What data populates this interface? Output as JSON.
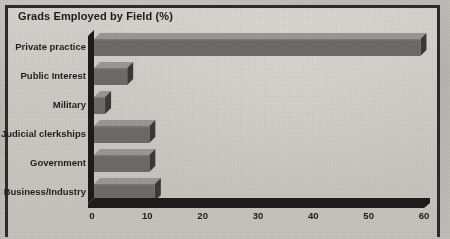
{
  "chart_data": {
    "type": "bar",
    "orientation": "horizontal",
    "title": "Grads Employed by Field (%)",
    "xlabel": "",
    "ylabel": "",
    "categories": [
      "Private practice",
      "Public Interest",
      "Military",
      "Judicial clerkships",
      "Government",
      "Business/Industry"
    ],
    "values": [
      59,
      6,
      2,
      10,
      10,
      11
    ],
    "xlim": [
      0,
      60
    ],
    "xticks": [
      0,
      10,
      20,
      30,
      40,
      50,
      60
    ],
    "xtick_labels": [
      "0",
      "10",
      "20",
      "30",
      "40",
      "50",
      "60"
    ],
    "grid": false,
    "legend": null,
    "style": "3d-bars",
    "colors": {
      "bar_front": "#6d6b68",
      "bar_top": "#9a9894",
      "bar_side": "#3c3a38",
      "axis": "#1e1c1b",
      "plot_background": "#cecbc5",
      "page_background": "#b9b7b1",
      "text": "#1d1b1a",
      "frame": "#2e2c2a"
    }
  }
}
